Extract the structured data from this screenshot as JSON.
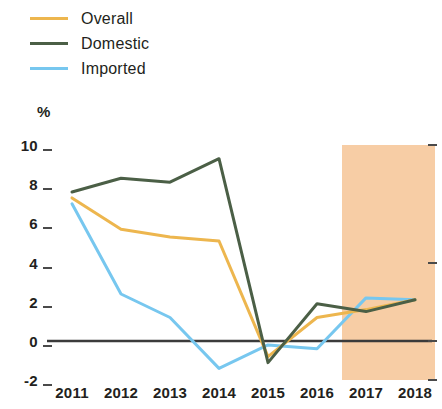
{
  "chart_data": {
    "type": "line",
    "title": "",
    "subtitle": "",
    "xlabel": "",
    "ylabel": "%",
    "categories": [
      "2011",
      "2012",
      "2013",
      "2014",
      "2015",
      "2016",
      "2017",
      "2018"
    ],
    "x": [
      2011,
      2012,
      2013,
      2014,
      2015,
      2016,
      2017,
      2018
    ],
    "ylim": [
      -2,
      10
    ],
    "xlim": [
      2011,
      2018
    ],
    "yticks": [
      10,
      8,
      6,
      4,
      2,
      0,
      -2
    ],
    "ytick_labels": [
      "10",
      "8",
      "6",
      "4",
      "2",
      "0",
      "-2"
    ],
    "grid": false,
    "legend_position": "top-left",
    "zero_line": 0,
    "series": [
      {
        "name": "Overall",
        "color": "#edb64e",
        "values": [
          7.3,
          5.7,
          5.3,
          5.1,
          -0.8,
          1.2,
          1.6,
          2.1
        ]
      },
      {
        "name": "Domestic",
        "color": "#4b5f46",
        "values": [
          7.6,
          8.3,
          8.1,
          9.3,
          -1.1,
          1.9,
          1.5,
          2.1
        ]
      },
      {
        "name": "Imported",
        "color": "#77c7ef",
        "values": [
          7.0,
          2.4,
          1.2,
          -1.4,
          -0.2,
          -0.4,
          2.2,
          2.1
        ]
      }
    ],
    "shaded_region": {
      "label": "",
      "color": "#f7cda5",
      "x_start": 2016.5,
      "x_end": 2018.4
    }
  },
  "legend": {
    "items": [
      {
        "label": "Overall",
        "color": "#edb64e"
      },
      {
        "label": "Domestic",
        "color": "#4b5f46"
      },
      {
        "label": "Imported",
        "color": "#77c7ef"
      }
    ]
  },
  "axes": {
    "unit_label": "%",
    "y_ticks": [
      "10",
      "8",
      "6",
      "4",
      "2",
      "0",
      "-2"
    ],
    "x_ticks": [
      "2011",
      "2012",
      "2013",
      "2014",
      "2015",
      "2016",
      "2017",
      "2018"
    ]
  },
  "colors": {
    "overall": "#edb64e",
    "domestic": "#4b5f46",
    "imported": "#77c7ef",
    "shading": "#f7cda5",
    "axis": "#4a4a4a",
    "text": "#231f20"
  }
}
